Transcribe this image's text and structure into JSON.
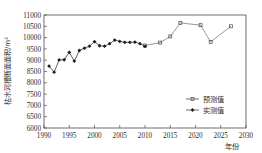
{
  "chart_data": {
    "type": "line",
    "title": "",
    "xlabel": "年份",
    "ylabel": "枯水河槽断面面积/m²",
    "xlim": [
      1990,
      2030
    ],
    "ylim": [
      6000,
      11000
    ],
    "xticks": [
      1990,
      1995,
      2000,
      2005,
      2010,
      2015,
      2020,
      2025,
      2030
    ],
    "yticks": [
      6000,
      6500,
      7000,
      7500,
      8000,
      8500,
      9000,
      9500,
      10000,
      10500,
      11000
    ],
    "grid": false,
    "legend_position": "center-right",
    "series": [
      {
        "name": "预测值",
        "marker": "open-square",
        "x": [
          2010,
          2013,
          2015,
          2017,
          2021,
          2023,
          2027
        ],
        "values": [
          9650,
          9780,
          10050,
          10650,
          10550,
          9810,
          10500
        ]
      },
      {
        "name": "实测值",
        "marker": "filled-diamond",
        "x": [
          1991,
          1992,
          1993,
          1994,
          1995,
          1996,
          1997,
          1998,
          1999,
          2000,
          2001,
          2002,
          2003,
          2004,
          2005,
          2006,
          2007,
          2008,
          2009,
          2010
        ],
        "values": [
          8740,
          8470,
          9010,
          9020,
          9350,
          8960,
          9430,
          9530,
          9620,
          9820,
          9640,
          9620,
          9730,
          9890,
          9830,
          9790,
          9790,
          9800,
          9730,
          9610
        ]
      }
    ]
  },
  "axis": {
    "x_label": "年份",
    "y_label": "枯水河槽断面面积/m²",
    "x_tick_labels": [
      "1990",
      "1995",
      "2000",
      "2005",
      "2010",
      "2015",
      "2020",
      "2025",
      "2030"
    ],
    "y_tick_labels": [
      "11000",
      "10500",
      "10000",
      "9500",
      "9000",
      "8500",
      "8000",
      "7500",
      "7000",
      "6500",
      "6000"
    ]
  },
  "legend": {
    "items": [
      {
        "label": "预测值"
      },
      {
        "label": "实测值"
      }
    ]
  },
  "colors": {
    "axis": "#4a4a4a",
    "measured": "#1d1d1d",
    "predicted": "#6b6b6b",
    "text": "#2b2b2b",
    "background": "#ffffff"
  }
}
